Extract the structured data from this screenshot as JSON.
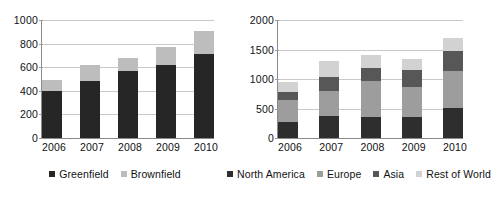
{
  "chart_data": [
    {
      "id": "left",
      "type": "bar",
      "stacked": true,
      "title": "",
      "xlabel": "",
      "ylabel": "",
      "categories": [
        "2006",
        "2007",
        "2008",
        "2009",
        "2010"
      ],
      "ylim": [
        0,
        1000
      ],
      "yticks": [
        0,
        200,
        400,
        600,
        800,
        1000
      ],
      "ytick_labels": [
        "0",
        "200",
        "400",
        "600",
        "800",
        "1000"
      ],
      "grid": true,
      "legend_position": "bottom",
      "series": [
        {
          "name": "Greenfield",
          "color": "#262626",
          "values": [
            395,
            480,
            565,
            620,
            715
          ]
        },
        {
          "name": "Brownfield",
          "color": "#bdbdbd",
          "values": [
            95,
            135,
            115,
            155,
            190
          ]
        }
      ],
      "totals": [
        490,
        615,
        680,
        775,
        905
      ]
    },
    {
      "id": "right",
      "type": "bar",
      "stacked": true,
      "title": "",
      "xlabel": "",
      "ylabel": "",
      "categories": [
        "2006",
        "2007",
        "2008",
        "2009",
        "2010"
      ],
      "ylim": [
        0,
        2000
      ],
      "yticks": [
        0,
        500,
        1000,
        1500,
        2000
      ],
      "ytick_labels": [
        "0",
        "500",
        "1000",
        "1500",
        "2000"
      ],
      "grid": true,
      "legend_position": "bottom",
      "series": [
        {
          "name": "North America",
          "color": "#2e2e2e",
          "values": [
            270,
            370,
            360,
            355,
            510
          ]
        },
        {
          "name": "Europe",
          "color": "#9d9d9d",
          "values": [
            375,
            430,
            600,
            510,
            620
          ]
        },
        {
          "name": "Asia",
          "color": "#575757",
          "values": [
            140,
            230,
            230,
            290,
            340
          ]
        },
        {
          "name": "Rest of World",
          "color": "#d2d2d2",
          "values": [
            170,
            270,
            225,
            180,
            220
          ]
        }
      ],
      "totals": [
        955,
        1300,
        1415,
        1335,
        1690
      ]
    }
  ]
}
